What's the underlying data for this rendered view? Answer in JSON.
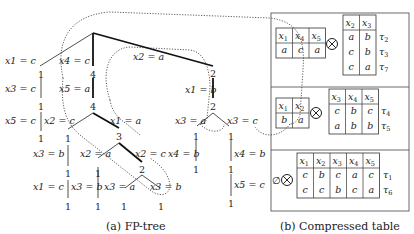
{
  "fp_tree": {
    "caption": "(a) FP-tree",
    "edges": [
      {
        "label": "x1 = c",
        "count": "1"
      },
      {
        "label": "x3 = c",
        "count": "1"
      },
      {
        "label": "x5 = c",
        "count": "1"
      },
      {
        "label": "x4 = c",
        "count": "4"
      },
      {
        "label": "x5 = a",
        "count": "4"
      },
      {
        "label": "x2 = c",
        "count": "1"
      },
      {
        "label": "x3 = b",
        "count": "1"
      },
      {
        "label": "x1 = c",
        "count": "1"
      },
      {
        "label": "x1 = a",
        "count": "3"
      },
      {
        "label": "x2 = a",
        "count": "1"
      },
      {
        "label": "x3 = b",
        "count": "1"
      },
      {
        "label": "x2 = c",
        "count": "2"
      },
      {
        "label": "x3 = a",
        "count": "1"
      },
      {
        "label": "x3 = b",
        "count": "1"
      },
      {
        "label": "x2 = a",
        "count": "2"
      },
      {
        "label": "x1 = b",
        "count": "2"
      },
      {
        "label": "x3 = a",
        "count": "1"
      },
      {
        "label": "x4 = b",
        "count": "1"
      },
      {
        "label": "x3 = c",
        "count": "1"
      },
      {
        "label": "x4 = b",
        "count": "1"
      },
      {
        "label": "x5 = c",
        "count": "1"
      }
    ]
  },
  "compressed_table": {
    "caption": "(b) Compressed table",
    "otimes": "⊗",
    "emptyset": "∅",
    "groups": [
      {
        "left": {
          "headers": [
            "x1",
            "x4",
            "x5"
          ],
          "rows": [
            [
              "a",
              "c",
              "a"
            ]
          ]
        },
        "right": {
          "headers": [
            "x2",
            "x3"
          ],
          "rows": [
            [
              "a",
              "b"
            ],
            [
              "c",
              "b"
            ],
            [
              "c",
              "a"
            ]
          ]
        },
        "tuples": [
          "τ2",
          "τ3",
          "τ7"
        ]
      },
      {
        "left": {
          "headers": [
            "x1",
            "x2"
          ],
          "rows": [
            [
              "b",
              "a"
            ]
          ]
        },
        "right": {
          "headers": [
            "x3",
            "x4",
            "x5"
          ],
          "rows": [
            [
              "c",
              "b",
              "c"
            ],
            [
              "a",
              "b",
              "b"
            ]
          ]
        },
        "tuples": [
          "τ4",
          "τ5"
        ]
      },
      {
        "left": null,
        "right": {
          "headers": [
            "x1",
            "x2",
            "x3",
            "x4",
            "x5"
          ],
          "rows": [
            [
              "c",
              "b",
              "c",
              "a",
              "c"
            ],
            [
              "c",
              "c",
              "b",
              "c",
              "a"
            ]
          ]
        },
        "tuples": [
          "τ1",
          "τ6"
        ]
      }
    ]
  }
}
